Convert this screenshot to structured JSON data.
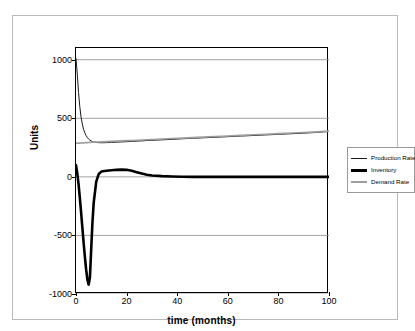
{
  "chart_data": {
    "type": "line",
    "title": "",
    "xlabel": "time  (months)",
    "ylabel": "Units",
    "xlim": [
      0,
      100
    ],
    "ylim": [
      -1000,
      1100
    ],
    "grid": true,
    "grid_axis": "y",
    "legend_position": "right",
    "xticks": [
      "0",
      "20",
      "40",
      "60",
      "80",
      "100"
    ],
    "xtick_values": [
      0,
      20,
      40,
      60,
      80,
      100
    ],
    "yticks": [
      "1000",
      "500",
      "0",
      "-500",
      "-1000"
    ],
    "ytick_values": [
      1000,
      500,
      0,
      -500,
      -1000
    ],
    "x": [
      0,
      0.5,
      1,
      1.5,
      2,
      2.5,
      3,
      3.5,
      4,
      4.5,
      5,
      5.5,
      6,
      6.5,
      7,
      8,
      9,
      10,
      12,
      14,
      16,
      18,
      20,
      22,
      24,
      26,
      28,
      30,
      34,
      38,
      42,
      46,
      50,
      55,
      60,
      65,
      70,
      75,
      80,
      85,
      90,
      95,
      100
    ],
    "series": [
      {
        "name": "Production Rate",
        "color": "#1a1a1a",
        "width": 1,
        "values": [
          1010,
          880,
          720,
          600,
          510,
          450,
          405,
          375,
          352,
          335,
          322,
          313,
          307,
          302,
          298,
          294,
          292,
          291,
          292,
          294,
          296,
          298,
          300,
          303,
          305,
          307,
          310,
          312,
          316,
          320,
          325,
          329,
          333,
          338,
          343,
          348,
          353,
          358,
          363,
          368,
          373,
          379,
          388
        ]
      },
      {
        "name": "Inventory",
        "color": "#000000",
        "width": 2.6,
        "values": [
          100,
          30,
          -60,
          -175,
          -300,
          -430,
          -560,
          -680,
          -790,
          -875,
          -920,
          -860,
          -620,
          -390,
          -220,
          -40,
          25,
          45,
          52,
          56,
          60,
          62,
          60,
          52,
          40,
          28,
          18,
          12,
          6,
          3,
          1,
          0,
          0,
          0,
          0,
          0,
          0,
          0,
          0,
          0,
          0,
          0,
          0
        ]
      },
      {
        "name": "Demand Rate",
        "color": "#9e9e9e",
        "width": 1.6,
        "values": [
          286,
          287,
          288,
          288,
          289,
          290,
          290,
          291,
          292,
          292,
          293,
          294,
          294,
          295,
          296,
          297,
          298,
          299,
          301,
          303,
          305,
          307,
          309,
          311,
          313,
          315,
          317,
          319,
          323,
          327,
          331,
          335,
          339,
          344,
          349,
          354,
          359,
          364,
          369,
          374,
          379,
          384,
          390
        ]
      }
    ]
  },
  "legend": {
    "items": [
      {
        "label": "Production Rate",
        "color": "#1a1a1a",
        "thickness": 1
      },
      {
        "label": "Inventory",
        "color": "#000000",
        "thickness": 3
      },
      {
        "label": "Demand Rate",
        "color": "#9e9e9e",
        "thickness": 2
      }
    ]
  }
}
